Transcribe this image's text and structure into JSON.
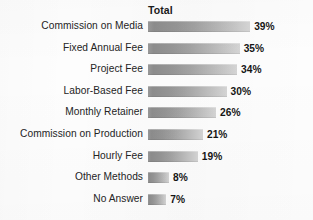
{
  "header": {
    "column_label": "Total"
  },
  "style": {
    "bar_gradient_start": "#8d8d8d",
    "bar_gradient_end": "#d6d6d6",
    "label_color": "#242424",
    "value_color": "#151515",
    "background": "#fdfdfd"
  },
  "chart_data": {
    "type": "bar",
    "orientation": "horizontal",
    "title": "",
    "subtitle": "",
    "xlabel": "",
    "ylabel": "",
    "legend": [],
    "legend_position": "none",
    "grid": false,
    "xlim": [
      0,
      45
    ],
    "series_name": "Total",
    "categories": [
      "Commission on Media",
      "Fixed Annual Fee",
      "Project Fee",
      "Labor-Based Fee",
      "Monthly Retainer",
      "Commission on Production",
      "Hourly Fee",
      "Other Methods",
      "No Answer"
    ],
    "values": [
      39,
      35,
      34,
      30,
      26,
      21,
      19,
      8,
      7
    ],
    "value_labels": [
      "39%",
      "35%",
      "34%",
      "30%",
      "26%",
      "21%",
      "19%",
      "8%",
      "7%"
    ],
    "units": "percent",
    "px_per_unit": 2.62
  }
}
